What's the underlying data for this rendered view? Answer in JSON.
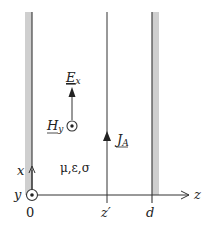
{
  "diagram": {
    "colors": {
      "line": "#333333",
      "wall_fill": "#cfcfcf",
      "text": "#222222"
    },
    "axes": {
      "horizontal_label": "z",
      "vertical_label": "x",
      "out_of_page_label": "y"
    },
    "ticks": {
      "origin": "0",
      "source": "z′",
      "wall": "d"
    },
    "fields": {
      "electric": {
        "symbol": "E",
        "subscript": "x"
      },
      "magnetic": {
        "symbol": "H",
        "subscript": "y"
      },
      "current": {
        "symbol": "J",
        "subscript": "A"
      }
    },
    "medium_label": "μ,ε,σ"
  }
}
